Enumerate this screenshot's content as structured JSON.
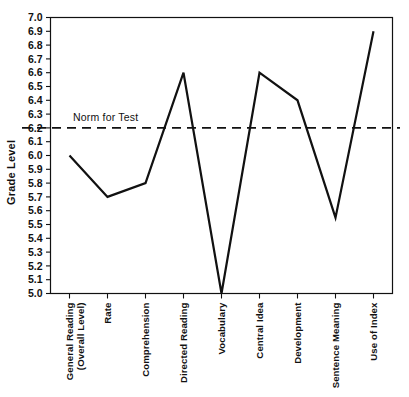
{
  "chart_data": {
    "type": "line",
    "title": "",
    "xlabel": "",
    "ylabel": "Grade Level",
    "ylim": [
      5.0,
      7.0
    ],
    "ytick_step": 0.1,
    "grid": false,
    "legend": "none",
    "categories": [
      "General Reading\n(Overall Level)",
      "Rate",
      "Comprehension",
      "Directed Reading",
      "Vocabulary",
      "Central Idea",
      "Development",
      "Sentence Meaning",
      "Use of Index"
    ],
    "values": [
      6.0,
      5.7,
      5.8,
      6.6,
      5.0,
      6.6,
      6.4,
      5.55,
      6.9
    ],
    "yticks": [
      "7.0",
      "6.9",
      "6.8",
      "6.7",
      "6.6",
      "6.5",
      "6.4",
      "6.3",
      "6.2",
      "6.1",
      "6.0",
      "5.9",
      "5.8",
      "5.7",
      "5.6",
      "5.5",
      "5.4",
      "5.3",
      "5.2",
      "5.1",
      "5.0"
    ],
    "annotations": [
      {
        "name": "norm-for-test",
        "label": "Norm for Test",
        "value": 6.2,
        "style": "dashed-horizontal-line"
      }
    ],
    "colors": {
      "line": "#111111",
      "axis": "#111111",
      "background": "#ffffff",
      "norm": "#111111"
    }
  },
  "axis": {
    "y_title": "Grade Level"
  }
}
